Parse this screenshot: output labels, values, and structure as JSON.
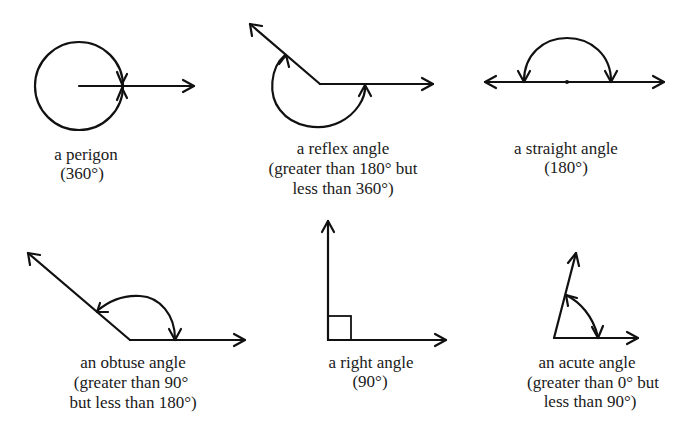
{
  "figure": {
    "stroke_color": "#111111",
    "text_color": "#1a1a1a",
    "background": "#ffffff"
  },
  "angles": [
    {
      "id": "perigon",
      "lines": [
        "a perigon",
        "(360°)"
      ],
      "degrees": 360
    },
    {
      "id": "reflex",
      "lines": [
        "a reflex angle",
        "(greater than 180° but",
        "less than 360°)"
      ],
      "range": [
        180,
        360
      ]
    },
    {
      "id": "straight",
      "lines": [
        "a straight angle",
        "(180°)"
      ],
      "degrees": 180
    },
    {
      "id": "obtuse",
      "lines": [
        "an obtuse angle",
        "(greater than 90°",
        "but less than 180°)"
      ],
      "range": [
        90,
        180
      ]
    },
    {
      "id": "right",
      "lines": [
        "a right angle",
        "(90°)"
      ],
      "degrees": 90
    },
    {
      "id": "acute",
      "lines": [
        "an acute angle",
        "(greater than 0° but",
        "less than 90°)"
      ],
      "range": [
        0,
        90
      ]
    }
  ]
}
